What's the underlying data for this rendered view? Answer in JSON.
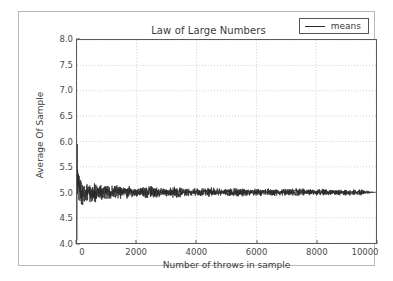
{
  "chart_data": {
    "type": "line",
    "title": "Law of Large Numbers",
    "xlabel": "Number of throws in sample",
    "ylabel": "Average Of Sample",
    "xlim": [
      0,
      10000
    ],
    "ylim": [
      4.0,
      8.0
    ],
    "xticks": [
      0,
      2000,
      4000,
      6000,
      8000,
      10000
    ],
    "xtick_labels": [
      "0",
      "2000",
      "4000",
      "6000",
      "8000",
      "10000"
    ],
    "yticks": [
      4.0,
      4.5,
      5.0,
      5.5,
      6.0,
      6.5,
      7.0,
      7.5,
      8.0
    ],
    "ytick_labels": [
      "4.0",
      "4.5",
      "5.0",
      "5.5",
      "6.0",
      "6.5",
      "7.0",
      "7.5",
      "8.0"
    ],
    "grid": true,
    "grid_style": "dotted",
    "grid_color": "#cccccc",
    "legend_position": "upper right",
    "line_color": "#2a2a2a",
    "converges_to": 5.0,
    "series": [
      {
        "name": "means",
        "description": "Running average of die throws converging to 5.0",
        "x": [
          1,
          5,
          10,
          20,
          30,
          40,
          50,
          60,
          70,
          80,
          90,
          100,
          125,
          150,
          175,
          200,
          250,
          300,
          350,
          400,
          450,
          500,
          600,
          700,
          800,
          900,
          1000,
          1200,
          1400,
          1600,
          1800,
          2000,
          2500,
          3000,
          3500,
          4000,
          4500,
          5000,
          5500,
          6000,
          6500,
          7000,
          7500,
          8000,
          8500,
          9000,
          9500,
          10000
        ],
        "y": [
          4.05,
          5.95,
          5.4,
          4.45,
          5.6,
          4.6,
          5.45,
          4.7,
          5.35,
          4.75,
          5.3,
          4.78,
          5.28,
          4.8,
          5.25,
          4.83,
          5.22,
          4.85,
          5.2,
          4.87,
          5.18,
          4.88,
          5.16,
          4.89,
          5.14,
          4.9,
          5.13,
          4.91,
          5.12,
          4.92,
          5.11,
          4.93,
          5.1,
          4.94,
          5.09,
          4.95,
          5.08,
          4.955,
          5.07,
          4.96,
          5.065,
          4.965,
          5.06,
          4.97,
          5.055,
          4.975,
          5.05,
          5.0
        ]
      }
    ]
  },
  "legend": {
    "entries": [
      {
        "label": "means"
      }
    ]
  }
}
